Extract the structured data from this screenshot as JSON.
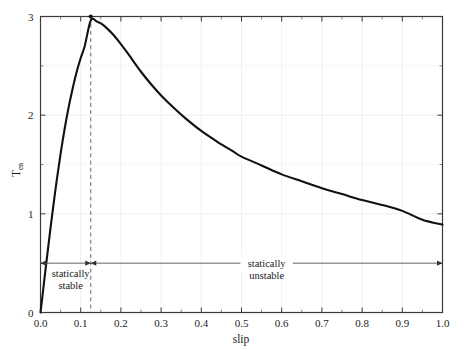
{
  "chart_data": {
    "type": "line",
    "title": "",
    "xlabel": "slip",
    "ylabel": "T",
    "ylabel_sub": "en",
    "xlim": [
      0.0,
      1.0
    ],
    "ylim": [
      0,
      3
    ],
    "grid": true,
    "legend": "none",
    "xticks": [
      "0.0",
      "0.1",
      "0.2",
      "0.3",
      "0.4",
      "0.5",
      "0.6",
      "0.7",
      "0.8",
      "0.9",
      "1.0"
    ],
    "xtick_values": [
      0.0,
      0.1,
      0.2,
      0.3,
      0.4,
      0.5,
      0.6,
      0.7,
      0.8,
      0.9,
      1.0
    ],
    "yticks": [
      "0",
      "1",
      "2",
      "3"
    ],
    "ytick_values": [
      0,
      1,
      2,
      3
    ],
    "x": [
      0.0,
      0.005,
      0.01,
      0.015,
      0.02,
      0.025,
      0.03,
      0.04,
      0.05,
      0.06,
      0.07,
      0.08,
      0.09,
      0.1,
      0.11,
      0.125,
      0.14,
      0.15,
      0.16,
      0.18,
      0.2,
      0.22,
      0.25,
      0.28,
      0.3,
      0.33,
      0.36,
      0.4,
      0.44,
      0.48,
      0.5,
      0.55,
      0.6,
      0.65,
      0.7,
      0.75,
      0.8,
      0.85,
      0.9,
      0.95,
      1.0
    ],
    "y": [
      0.0,
      0.17,
      0.35,
      0.52,
      0.69,
      0.86,
      1.02,
      1.33,
      1.61,
      1.86,
      2.08,
      2.27,
      2.44,
      2.58,
      2.7,
      2.96,
      2.95,
      2.93,
      2.9,
      2.82,
      2.72,
      2.61,
      2.44,
      2.29,
      2.2,
      2.08,
      1.97,
      1.84,
      1.73,
      1.63,
      1.58,
      1.49,
      1.4,
      1.33,
      1.26,
      1.2,
      1.14,
      1.09,
      1.03,
      0.94,
      0.89
    ],
    "peak": {
      "x": 0.125,
      "y": 3.0,
      "marker": "dot",
      "dashed_guideline": true
    },
    "annotations": [
      {
        "name": "statically-stable",
        "lines": [
          "statically",
          "stable"
        ],
        "arrow": {
          "from_x": 0.0,
          "to_x": 0.125,
          "y": 0.5,
          "double_headed": true
        }
      },
      {
        "name": "statically-unstable",
        "lines": [
          "statically",
          "unstable"
        ],
        "arrow": {
          "from_x": 0.125,
          "to_x": 1.0,
          "y": 0.5,
          "double_headed": true
        }
      }
    ],
    "colors": {
      "curve": "#111111",
      "frame": "#3a3a3a",
      "grid": "#efefef",
      "dashed": "#6a6a6a",
      "arrow": "#555555",
      "background": "#ffffff"
    }
  }
}
